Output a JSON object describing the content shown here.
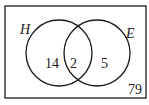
{
  "diagram": {
    "type": "venn",
    "sets": [
      {
        "label": "H",
        "only_count": "14"
      },
      {
        "label": "E",
        "only_count": "5"
      }
    ],
    "intersection_count": "2",
    "outside_count": "79",
    "colors": {
      "stroke": "#1a1a1a",
      "background": "#ffffff"
    }
  }
}
